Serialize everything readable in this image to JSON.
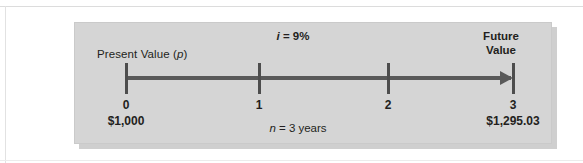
{
  "figure": {
    "type": "timeline-diagram",
    "topic": "Future value of a present sum",
    "present_value_label_prefix": "Present Value (",
    "present_value_label_var": "p",
    "present_value_label_suffix": ")",
    "interest_var": "i",
    "interest_text": " = 9%",
    "future_value_line1": "Future",
    "future_value_line2": "Value",
    "periods_var": "n",
    "periods_text": " = 3 years",
    "colors": {
      "panel_background": "#d5d5d5",
      "panel_shadow": "#cfcfcf",
      "axis": "#595959",
      "tick": "#4d4d4d",
      "text": "#231f20",
      "page_background": "#ffffff"
    }
  },
  "chart_data": {
    "type": "timeline",
    "title": "",
    "xlabel": "",
    "ylabel": "",
    "interest_rate": "9%",
    "periods": 3,
    "present_value": "$1,000",
    "future_value": "$1,295.03",
    "categories": [
      "0",
      "1",
      "2",
      "3"
    ],
    "points": [
      {
        "period": "0",
        "amount": "$1,000"
      },
      {
        "period": "1",
        "amount": ""
      },
      {
        "period": "2",
        "amount": ""
      },
      {
        "period": "3",
        "amount": "$1,295.03"
      }
    ],
    "annotations": [
      "i = 9%",
      "n = 3 years",
      "Present Value (p)",
      "Future Value"
    ]
  }
}
